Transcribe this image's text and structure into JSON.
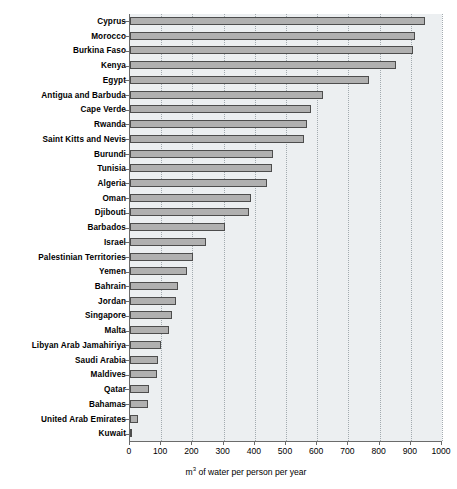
{
  "chart_data": {
    "type": "bar",
    "orientation": "horizontal",
    "title": "",
    "xlabel": "m³ of water per person per year",
    "ylabel": "",
    "xlim": [
      0,
      1000
    ],
    "xticks": [
      0,
      100,
      200,
      300,
      400,
      500,
      600,
      700,
      800,
      900,
      1000
    ],
    "xtick_labels": [
      "0",
      "100",
      "200",
      "300",
      "400",
      "500",
      "600",
      "700",
      "800",
      "900",
      "1000"
    ],
    "grid": true,
    "grid_axis": "x",
    "grid_style": "dotted",
    "legend": false,
    "categories": [
      "Cyprus",
      "Morocco",
      "Burkina Faso",
      "Kenya",
      "Egypt",
      "Antigua and Barbuda",
      "Cape Verde",
      "Rwanda",
      "Saint Kitts and Nevis",
      "Burundi",
      "Tunisia",
      "Algeria",
      "Oman",
      "Djibouti",
      "Barbados",
      "Israel",
      "Palestinian Territories",
      "Yemen",
      "Bahrain",
      "Jordan",
      "Singapore",
      "Malta",
      "Libyan Arab Jamahiriya",
      "Saudi Arabia",
      "Maldives",
      "Qatar",
      "Bahamas",
      "United Arab Emirates",
      "Kuwait"
    ],
    "values": [
      947,
      913,
      906,
      852,
      766,
      617,
      580,
      566,
      559,
      457,
      456,
      439,
      388,
      380,
      305,
      242,
      203,
      183,
      154,
      148,
      134,
      124,
      99,
      90,
      85,
      60,
      59,
      25,
      7
    ],
    "bar_fill_color": "#b0b0b0",
    "bar_edge_color": "#4d4d4d",
    "plot_background_color": "#eceff1",
    "figure_background_color": "#ffffff",
    "axis_color": "#6b6b6b",
    "gridline_color": "#9aa3a8"
  }
}
